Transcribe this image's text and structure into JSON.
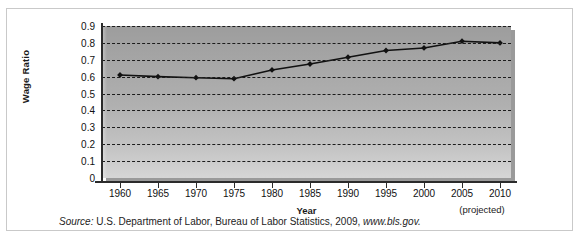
{
  "chart_data": {
    "type": "line",
    "title": "",
    "xlabel": "Year",
    "ylabel": "Wage Ratio",
    "x": [
      1960,
      1965,
      1970,
      1975,
      1980,
      1985,
      1990,
      1995,
      2000,
      2005,
      2010
    ],
    "categories": [
      "1960",
      "1965",
      "1970",
      "1975",
      "1980",
      "1985",
      "1990",
      "1995",
      "2000",
      "2005",
      "2010"
    ],
    "values": [
      0.61,
      0.6,
      0.594,
      0.588,
      0.64,
      0.675,
      0.715,
      0.755,
      0.77,
      0.81,
      0.8
    ],
    "series": [
      {
        "name": "Wage Ratio",
        "values": [
          0.61,
          0.6,
          0.594,
          0.588,
          0.64,
          0.675,
          0.715,
          0.755,
          0.77,
          0.81,
          0.8
        ]
      }
    ],
    "ylim": [
      0,
      0.9
    ],
    "ytick_labels": [
      "0.9",
      "0.8",
      "0.7",
      "0.6",
      "0.5",
      "0.4",
      "0.3",
      "0.2",
      "0.1",
      "0"
    ],
    "ytick_values": [
      0.9,
      0.8,
      0.7,
      0.6,
      0.5,
      0.4,
      0.3,
      0.2,
      0.1,
      0
    ],
    "xlim": [
      1960,
      2010
    ],
    "grid": "horizontal-dashed",
    "legend": "none",
    "annotations": [
      "(projected)"
    ],
    "marker": "diamond",
    "line_color": "#111111",
    "plot_background": "#ababab"
  },
  "axes": {
    "y_title": "Wage Ratio",
    "x_title": "Year",
    "projected_note": "(projected)"
  },
  "source": {
    "label": "Source:",
    "text": " U.S. Department of Labor, Bureau of Labor Statistics, 2009, ",
    "url": "www.bls.gov.",
    "full": "Source: U.S. Department of Labor, Bureau of Labor Statistics, 2009, www.bls.gov."
  }
}
